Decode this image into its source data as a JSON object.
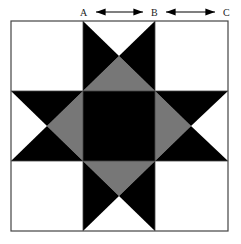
{
  "diagram": {
    "type": "quilt-block",
    "labels": {
      "a": "A",
      "b": "B",
      "c": "C"
    },
    "measurements": [
      {
        "from": "A",
        "to": "B"
      },
      {
        "from": "B",
        "to": "C"
      }
    ],
    "colors": {
      "background": "#ffffff",
      "outline": "#555555",
      "dark": "#000000",
      "medium": "#777777"
    }
  }
}
